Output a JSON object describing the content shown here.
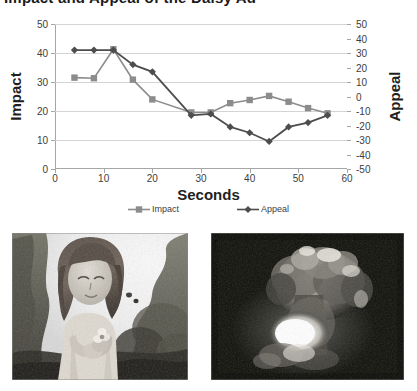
{
  "title": "Impact and Appeal of the Daisy Ad",
  "chart_data": {
    "type": "line",
    "title": "Impact and Appeal of the Daisy Ad",
    "xlabel": "Seconds",
    "ylabel": "Impact",
    "y2label": "Appeal",
    "xlim": [
      0,
      60
    ],
    "ylim": [
      0,
      50
    ],
    "y2lim": [
      -50,
      50
    ],
    "xticks": [
      0,
      10,
      20,
      30,
      40,
      50,
      60
    ],
    "yticks": [
      0,
      10,
      20,
      30,
      40,
      50
    ],
    "y2ticks": [
      -50,
      -40,
      -30,
      -20,
      -10,
      0,
      10,
      20,
      30,
      40,
      50
    ],
    "grid": true,
    "legend_position": "bottom",
    "x": [
      4,
      8,
      12,
      16,
      20,
      28,
      32,
      36,
      40,
      44,
      48,
      52,
      56
    ],
    "series": [
      {
        "name": "Impact",
        "axis": "left",
        "marker": "square",
        "color": "#8c8c8c",
        "values": [
          31.5,
          31.3,
          41.3,
          30.8,
          24.0,
          19.5,
          19.5,
          22.7,
          23.8,
          25.2,
          23.2,
          21.0,
          19.2
        ]
      },
      {
        "name": "Appeal",
        "axis": "right",
        "marker": "diamond",
        "color": "#4d4d4d",
        "values": [
          32,
          32,
          32,
          22,
          17,
          -13,
          -12,
          -21,
          -25,
          -31,
          -21,
          -18,
          -13
        ]
      }
    ]
  },
  "legend": [
    {
      "label": "Impact",
      "color": "#8c8c8c",
      "marker": "square"
    },
    {
      "label": "Appeal",
      "color": "#4d4d4d",
      "marker": "diamond"
    }
  ],
  "photos": [
    {
      "caption": "girl-with-flower-in-field",
      "alt": "Black and white still of a young girl standing in a field holding a daisy"
    },
    {
      "caption": "nuclear-mushroom-cloud",
      "alt": "Black and white still of a nuclear explosion mushroom cloud"
    }
  ]
}
